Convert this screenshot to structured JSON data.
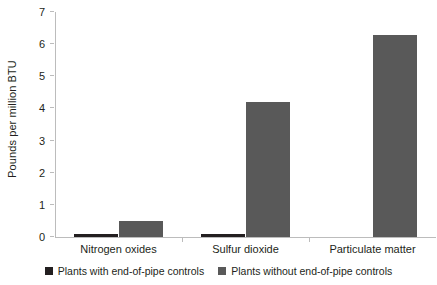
{
  "chart_data": {
    "type": "bar",
    "title": "",
    "xlabel": "",
    "ylabel": "Pounds per million BTU",
    "ylim": [
      0,
      7
    ],
    "yticks": [
      0,
      1,
      2,
      3,
      4,
      5,
      6,
      7
    ],
    "ytick_labels": [
      "0",
      "1",
      "2",
      "3",
      "4",
      "5",
      "6",
      "7"
    ],
    "grid": false,
    "legend_position": "bottom",
    "categories": [
      "Nitrogen oxides",
      "Sulfur dioxide",
      "Particulate matter"
    ],
    "series": [
      {
        "name": "Plants with end-of-pipe controls",
        "color": "#231f20",
        "values": [
          0.1,
          0.1,
          0.0
        ]
      },
      {
        "name": "Plants without end-of-pipe controls",
        "color": "#595959",
        "values": [
          0.5,
          4.2,
          6.3
        ]
      }
    ]
  },
  "legend": {
    "entries": [
      {
        "label": "Plants with end-of-pipe controls"
      },
      {
        "label": "Plants without end-of-pipe controls"
      }
    ]
  },
  "colors": {
    "axis": "#bcbcbc",
    "text": "#231f20",
    "series_dark": "#231f20",
    "series_gray": "#595959",
    "background": "#ffffff"
  }
}
